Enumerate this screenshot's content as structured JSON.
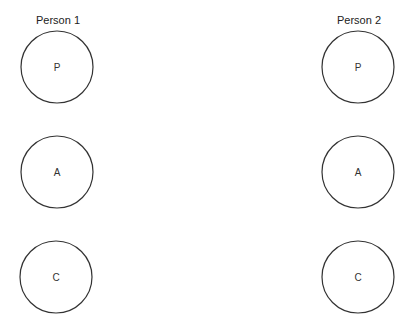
{
  "diagram": {
    "type": "ego-state-diagram",
    "persons": [
      {
        "label": "Person 1",
        "states": [
          {
            "letter": "P"
          },
          {
            "letter": "A"
          },
          {
            "letter": "C"
          }
        ]
      },
      {
        "label": "Person 2",
        "states": [
          {
            "letter": "P"
          },
          {
            "letter": "A"
          },
          {
            "letter": "C"
          }
        ]
      }
    ],
    "colors": {
      "stroke": "#333333",
      "text": "#222222",
      "background": "#ffffff"
    }
  }
}
